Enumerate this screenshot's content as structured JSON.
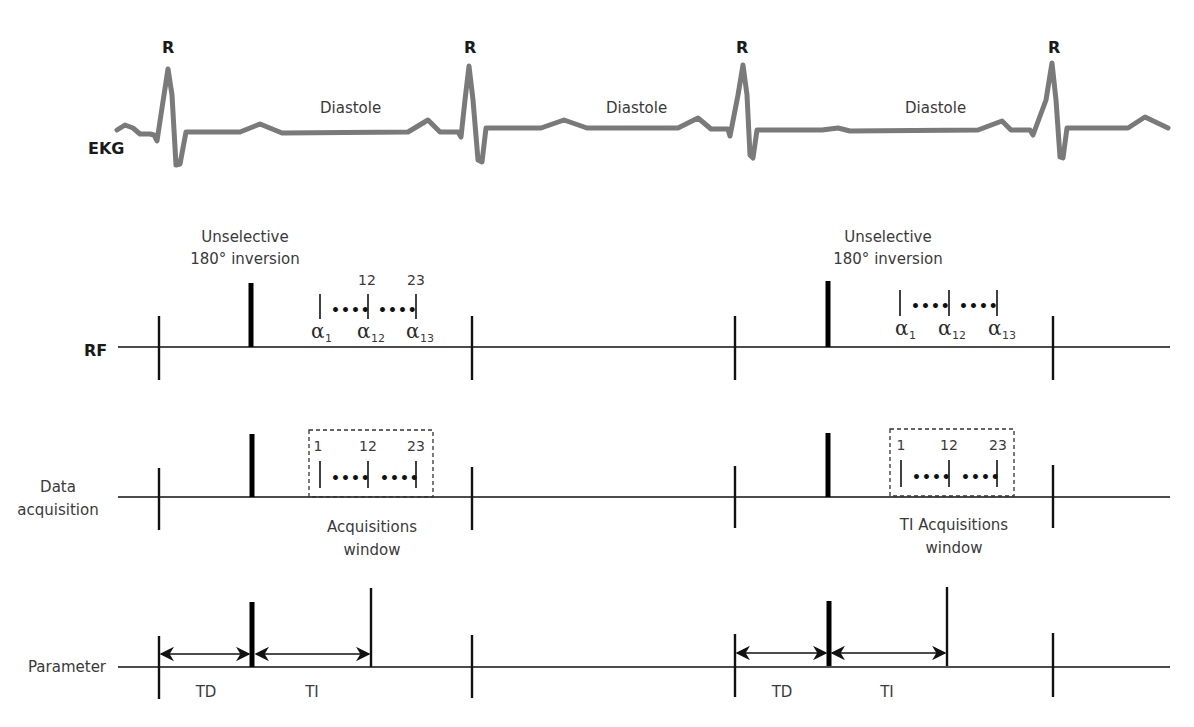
{
  "rows": {
    "ekg": {
      "label": "EKG"
    },
    "rf": {
      "label": "RF"
    },
    "data": {
      "label_line1": "Data",
      "label_line2": "acquisition"
    },
    "parameter": {
      "label": "Parameter"
    }
  },
  "ekg": {
    "r_labels": [
      "R",
      "R",
      "R",
      "R"
    ],
    "diastole_labels": [
      "Diastole",
      "Diastole",
      "Diastole"
    ]
  },
  "cycles": [
    {
      "inversion_line1": "Unselective",
      "inversion_line2": "180° inversion",
      "rf_top_numbers": [
        "12",
        "23"
      ],
      "rf_pulses": [
        {
          "symbol": "α",
          "sub": "1"
        },
        {
          "symbol": "α",
          "sub": "12"
        },
        {
          "symbol": "α",
          "sub": "13"
        }
      ],
      "rf_dots": [
        "••••",
        "••••"
      ],
      "acq_numbers": [
        "1",
        "12",
        "23"
      ],
      "acq_dots": [
        "••••",
        "••••"
      ],
      "acq_window_line1": "Acquisitions",
      "acq_window_line2": "window",
      "td_label": "TD",
      "ti_label": "TI"
    },
    {
      "inversion_line1": "Unselective",
      "inversion_line2": "180° inversion",
      "rf_top_numbers": [],
      "rf_pulses": [
        {
          "symbol": "α",
          "sub": "1"
        },
        {
          "symbol": "α",
          "sub": "12"
        },
        {
          "symbol": "α",
          "sub": "13"
        }
      ],
      "rf_dots": [
        "••••",
        "••••"
      ],
      "acq_numbers": [
        "1",
        "12",
        "23"
      ],
      "acq_dots": [
        "••••",
        "••••"
      ],
      "acq_window_line1": "TI Acquisitions",
      "acq_window_line2": "window",
      "td_label": "TD",
      "ti_label": "TI"
    }
  ],
  "colors": {
    "ekg_trace": "#7a7a7a",
    "lines": "#111111",
    "text": "#3a3a3a"
  }
}
